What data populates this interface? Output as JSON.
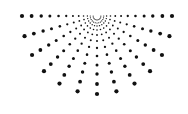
{
  "graphic": {
    "name": "radial-dot-burst",
    "background": "#ffffff",
    "dot_color": "#111111",
    "center": {
      "x": 97,
      "y": 16
    },
    "ray_count": 13,
    "angle_start_deg": 0,
    "angle_end_deg": 180,
    "radii": [
      4,
      7,
      10,
      14,
      19,
      25,
      32,
      40,
      49,
      58,
      68,
      78
    ],
    "dot_sizes": [
      0.5,
      0.6,
      0.7,
      0.8,
      0.9,
      1.0,
      1.15,
      1.3,
      1.5,
      1.7,
      1.9,
      2.1
    ],
    "outer_radius_horizontal": 75,
    "outer_radius_vertical": 78
  }
}
